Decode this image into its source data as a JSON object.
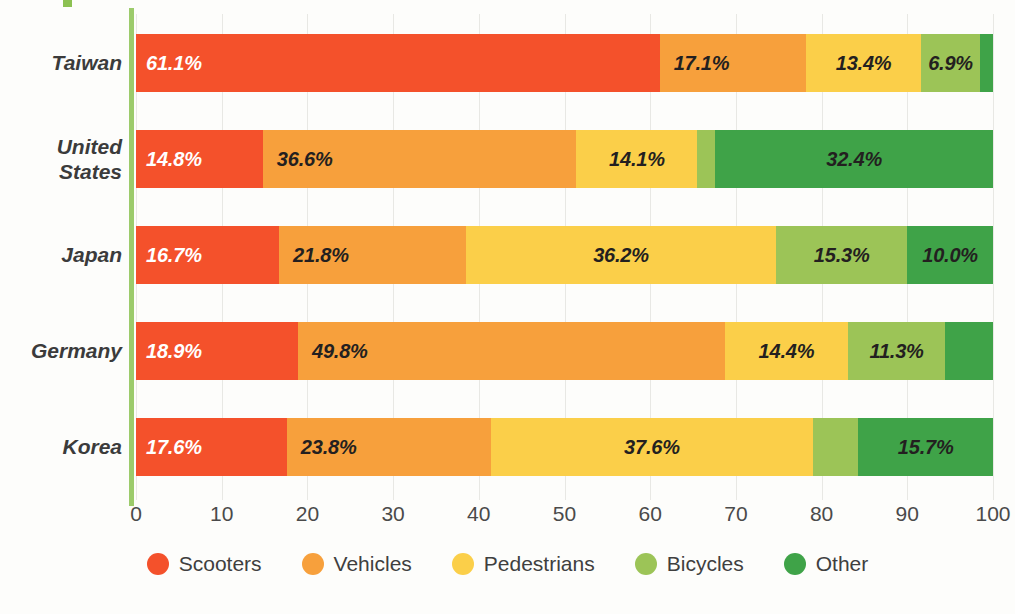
{
  "chart_data": {
    "type": "bar",
    "orientation": "horizontal",
    "stacked": true,
    "stack_unit": "percent",
    "title": "",
    "xlabel": "",
    "ylabel": "",
    "xlim": [
      0,
      100
    ],
    "xticks": [
      "0",
      "10",
      "20",
      "30",
      "40",
      "50",
      "60",
      "70",
      "80",
      "90",
      "100"
    ],
    "grid": true,
    "legend_position": "bottom",
    "categories": [
      "Taiwan",
      "United States",
      "Japan",
      "Germany",
      "Korea"
    ],
    "series": [
      {
        "name": "Scooters",
        "color": "#F4512B",
        "values": [
          61.1,
          14.8,
          16.7,
          18.9,
          17.6
        ],
        "labels": [
          "61.1%",
          "14.8%",
          "16.7%",
          "18.9%",
          "17.6%"
        ],
        "label_shown": [
          true,
          true,
          true,
          true,
          true
        ],
        "label_color": [
          "light",
          "light",
          "light",
          "light",
          "light"
        ]
      },
      {
        "name": "Vehicles",
        "color": "#F7A03C",
        "values": [
          17.1,
          36.6,
          21.8,
          49.8,
          23.8
        ],
        "labels": [
          "17.1%",
          "36.6%",
          "21.8%",
          "49.8%",
          "23.8%"
        ],
        "label_shown": [
          true,
          true,
          true,
          true,
          true
        ],
        "label_color": [
          "dark",
          "dark",
          "dark",
          "dark",
          "dark"
        ]
      },
      {
        "name": "Pedestrians",
        "color": "#FBCF49",
        "values": [
          13.4,
          14.1,
          36.2,
          14.4,
          37.6
        ],
        "labels": [
          "13.4%",
          "14.1%",
          "36.2%",
          "14.4%",
          "37.6%"
        ],
        "label_shown": [
          true,
          true,
          true,
          true,
          true
        ],
        "label_color": [
          "dark",
          "dark",
          "dark",
          "dark",
          "dark"
        ]
      },
      {
        "name": "Bicycles",
        "color": "#9CC457",
        "values": [
          6.9,
          2.1,
          15.3,
          11.3,
          5.3
        ],
        "labels": [
          "6.9%",
          "",
          "15.3%",
          "11.3%",
          ""
        ],
        "label_shown": [
          true,
          false,
          true,
          true,
          false
        ],
        "label_color": [
          "dark",
          "dark",
          "dark",
          "dark",
          "dark"
        ]
      },
      {
        "name": "Other",
        "color": "#3FA348",
        "values": [
          1.5,
          32.4,
          10.0,
          5.6,
          15.7
        ],
        "labels": [
          "",
          "32.4%",
          "10.0%",
          "",
          "15.7%"
        ],
        "label_shown": [
          false,
          true,
          true,
          false,
          true
        ],
        "label_color": [
          "dark",
          "dark",
          "dark",
          "dark",
          "dark"
        ]
      }
    ]
  },
  "legend": {
    "items": [
      {
        "label": "Scooters",
        "color": "#F4512B"
      },
      {
        "label": "Vehicles",
        "color": "#F7A03C"
      },
      {
        "label": "Pedestrians",
        "color": "#FBCF49"
      },
      {
        "label": "Bicycles",
        "color": "#9CC457"
      },
      {
        "label": "Other",
        "color": "#3FA348"
      }
    ]
  },
  "axis": {
    "y_axis_color": "#9CCB6B",
    "gridline_color": "#E8E8E4",
    "background": "#FDFDFB"
  }
}
